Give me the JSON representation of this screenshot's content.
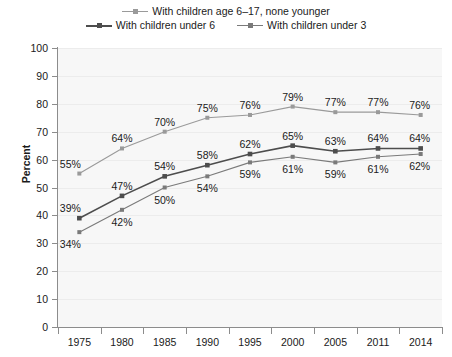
{
  "legend": {
    "rows": [
      [
        {
          "label": "With children age 6–17, none younger",
          "series": "age_6_17",
          "marker": "square-marker"
        }
      ],
      [
        {
          "label": "With children under 6",
          "series": "under_6",
          "marker": "square-marker"
        },
        {
          "label": "With children under 3",
          "series": "under_3",
          "marker": "square-marker"
        }
      ]
    ]
  },
  "axes": {
    "ylabel": "Percent",
    "yticks": [
      "0",
      "10",
      "20",
      "30",
      "40",
      "50",
      "60",
      "70",
      "80",
      "90",
      "100"
    ],
    "xticks": [
      "1975",
      "1980",
      "1985",
      "1990",
      "1995",
      "2000",
      "2005",
      "2011",
      "2014"
    ]
  },
  "colors": {
    "series_age_6_17": "#9a9a9a",
    "series_under_6": "#4d4d4d",
    "series_under_3": "#7a7a7a",
    "axis": "#8c8c8c",
    "plot_background": "#f7f7f7",
    "grid": "#ececec",
    "text": "#1a1a1a",
    "page_background": "#ffffff"
  },
  "chart_data": {
    "type": "line",
    "title": "",
    "xlabel": "",
    "ylabel": "Percent",
    "ylim": [
      0,
      100
    ],
    "ytick_step": 10,
    "grid": true,
    "legend_position": "top-center",
    "value_suffix": "%",
    "categories": [
      "1975",
      "1980",
      "1985",
      "1990",
      "1995",
      "2000",
      "2005",
      "2011",
      "2014"
    ],
    "series": [
      {
        "name": "With children age 6–17, none younger",
        "key": "age_6_17",
        "color": "#9a9a9a",
        "values": [
          55,
          64,
          70,
          75,
          76,
          79,
          77,
          77,
          76
        ],
        "labels": [
          "55%",
          "64%",
          "70%",
          "75%",
          "76%",
          "79%",
          "77%",
          "77%",
          "76%"
        ],
        "label_positions": [
          "above",
          "above",
          "above",
          "above",
          "above",
          "above",
          "above",
          "above",
          "above"
        ]
      },
      {
        "name": "With children under 6",
        "key": "under_6",
        "color": "#4d4d4d",
        "values": [
          39,
          47,
          54,
          58,
          62,
          65,
          63,
          64,
          64
        ],
        "labels": [
          "39%",
          "47%",
          "54%",
          "58%",
          "62%",
          "65%",
          "63%",
          "64%",
          "64%"
        ],
        "label_positions": [
          "above",
          "above",
          "above",
          "above",
          "above",
          "above",
          "above",
          "above",
          "above"
        ]
      },
      {
        "name": "With children under 3",
        "key": "under_3",
        "color": "#7a7a7a",
        "values": [
          34,
          42,
          50,
          54,
          59,
          61,
          59,
          61,
          62
        ],
        "labels": [
          "34%",
          "42%",
          "50%",
          "54%",
          "59%",
          "61%",
          "59%",
          "61%",
          "62%"
        ],
        "label_positions": [
          "below",
          "below",
          "below",
          "below",
          "below",
          "below",
          "below",
          "below",
          "below"
        ]
      }
    ]
  }
}
